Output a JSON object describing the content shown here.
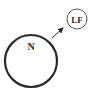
{
  "diagram": {
    "nodes": [
      {
        "id": "N",
        "label": "N",
        "cx": 31,
        "cy": 61,
        "r": 26,
        "stroke_width": 2.2
      },
      {
        "id": "LF",
        "label": "LF",
        "cx": 77,
        "cy": 19,
        "r": 10,
        "stroke_width": 1
      }
    ],
    "edges": [
      {
        "from": "N",
        "to": "LF",
        "x1": 52,
        "y1": 38,
        "x2": 63,
        "y2": 28,
        "arrow": "end"
      }
    ],
    "colors": {
      "stroke": "#2a2a2a",
      "background": "#ffffff"
    }
  }
}
